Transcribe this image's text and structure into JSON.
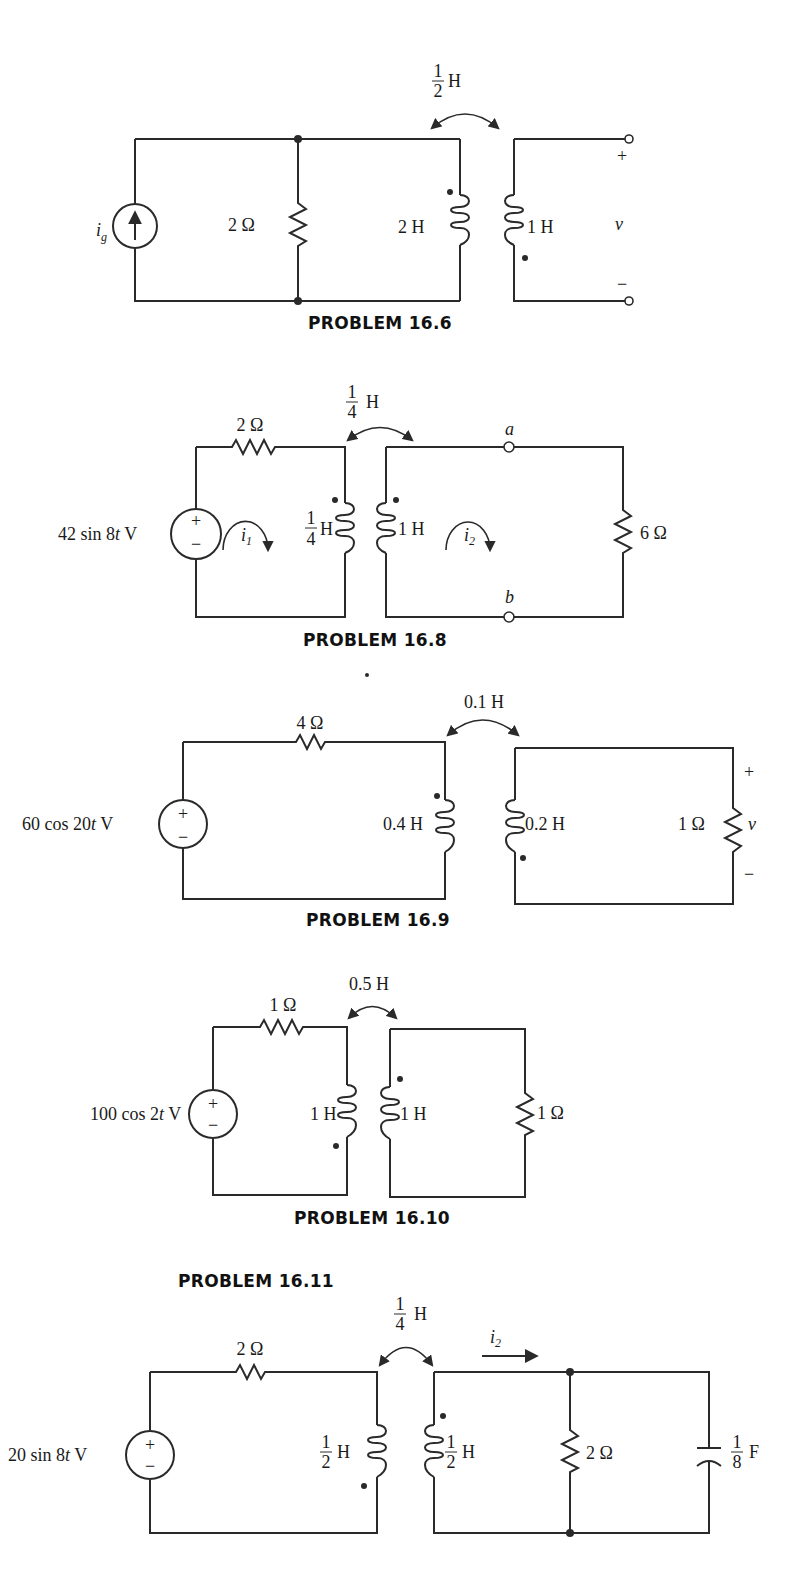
{
  "problems": [
    {
      "id": "16.6",
      "caption": "PROBLEM 16.6",
      "mutual": {
        "num": "1",
        "den": "2",
        "unit": "H"
      },
      "source": {
        "type": "current",
        "label_main": "i",
        "label_sub": "g"
      },
      "resistor": "2 Ω",
      "L1": "2 H",
      "L2": "1 H",
      "output": {
        "label": "v",
        "plus": "+",
        "minus": "−"
      }
    },
    {
      "id": "16.8",
      "caption": "PROBLEM 16.8",
      "mutual": {
        "num": "1",
        "den": "4",
        "unit": "H"
      },
      "source": {
        "type": "voltage",
        "label": "42 sin 8t V",
        "label_pre": "42 sin 8",
        "label_t": "t",
        "label_post": " V",
        "plus": "+",
        "minus": "−"
      },
      "series_resistor": "2 Ω",
      "L1": {
        "num": "1",
        "den": "4",
        "unit": "H"
      },
      "L2": "1 H",
      "mesh1": {
        "main": "i",
        "sub": "1"
      },
      "mesh2": {
        "main": "i",
        "sub": "2"
      },
      "terminal_a": "a",
      "terminal_b": "b",
      "load": "6 Ω"
    },
    {
      "id": "16.9",
      "caption": "PROBLEM 16.9",
      "mutual": "0.1 H",
      "source": {
        "type": "voltage",
        "label_pre": "60 cos 20",
        "label_t": "t",
        "label_post": " V",
        "plus": "+",
        "minus": "−"
      },
      "series_resistor": "4 Ω",
      "L1": "0.4 H",
      "L2": "0.2 H",
      "load": "1 Ω",
      "output": {
        "label": "v",
        "plus": "+",
        "minus": "−"
      }
    },
    {
      "id": "16.10",
      "caption": "PROBLEM 16.10",
      "mutual": "0.5 H",
      "source": {
        "type": "voltage",
        "label_pre": "100 cos 2",
        "label_t": "t",
        "label_post": " V",
        "plus": "+",
        "minus": "−"
      },
      "series_resistor": "1 Ω",
      "L1": "1 H",
      "L2": "1 H",
      "load": "1 Ω"
    },
    {
      "id": "16.11",
      "caption": "PROBLEM 16.11",
      "mutual": {
        "num": "1",
        "den": "4",
        "unit": "H"
      },
      "source": {
        "type": "voltage",
        "label_pre": "20 sin 8",
        "label_t": "t",
        "label_post": " V",
        "plus": "+",
        "minus": "−"
      },
      "series_resistor": "2 Ω",
      "L1": {
        "num": "1",
        "den": "2",
        "unit": "H"
      },
      "L2": {
        "num": "1",
        "den": "2",
        "unit": "H"
      },
      "current": {
        "main": "i",
        "sub": "2"
      },
      "shunt_resistor": "2 Ω",
      "capacitor": {
        "num": "1",
        "den": "8",
        "unit": "F"
      }
    }
  ]
}
